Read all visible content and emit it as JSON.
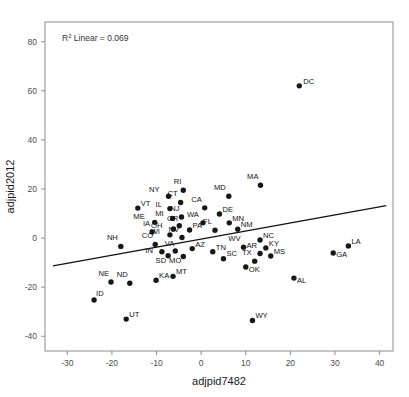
{
  "chart_data": {
    "type": "scatter",
    "title": "",
    "xlabel": "adjpid7482",
    "ylabel": "adjpid2012",
    "xlim": [
      -35,
      43
    ],
    "ylim": [
      -46,
      88
    ],
    "xticks": [
      -30,
      -20,
      -10,
      0,
      10,
      20,
      30,
      40
    ],
    "yticks": [
      -40,
      -20,
      0,
      20,
      40,
      60,
      80
    ],
    "grid": false,
    "legend": false,
    "annotation": {
      "text": "R2 Linear = 0.069",
      "r_squared": 0.069,
      "prefix": "R",
      "superscript": "2",
      "suffix": " Linear = 0.069"
    },
    "fit_line": {
      "type": "linear",
      "x_start": -33.2,
      "y_start": -11.3,
      "x_end": 41.5,
      "y_end": 13.2
    },
    "point_label_key": "state",
    "points": [
      {
        "state": "DC",
        "x": 22.0,
        "y": 62.0,
        "lx": 4,
        "ly": -2
      },
      {
        "state": "MA",
        "x": 13.3,
        "y": 21.5,
        "lx": -2,
        "ly": -6
      },
      {
        "state": "MD",
        "x": 6.2,
        "y": 17.0,
        "lx": -3,
        "ly": -6
      },
      {
        "state": "RI",
        "x": -4.0,
        "y": 19.5,
        "lx": -2,
        "ly": -6
      },
      {
        "state": "NY",
        "x": -7.3,
        "y": 17.0,
        "lx": -9,
        "ly": -4
      },
      {
        "state": "CT",
        "x": -4.6,
        "y": 14.5,
        "lx": -3,
        "ly": -6
      },
      {
        "state": "VT",
        "x": -14.2,
        "y": 12.2,
        "lx": 3,
        "ly": -2
      },
      {
        "state": "IL",
        "x": -7.0,
        "y": 12.0,
        "lx": -8,
        "ly": -2
      },
      {
        "state": "CA",
        "x": 0.8,
        "y": 12.3,
        "lx": -3,
        "ly": -6
      },
      {
        "state": "DE",
        "x": 4.1,
        "y": 9.8,
        "lx": 3,
        "ly": -2
      },
      {
        "state": "NJ",
        "x": -4.4,
        "y": 8.6,
        "lx": -2,
        "ly": -6
      },
      {
        "state": "MI",
        "x": -6.4,
        "y": 8.0,
        "lx": -9,
        "ly": -2
      },
      {
        "state": "ME",
        "x": -10.4,
        "y": 6.4,
        "lx": -10,
        "ly": -3
      },
      {
        "state": "WA",
        "x": 0.4,
        "y": 6.2,
        "lx": -4,
        "ly": -6
      },
      {
        "state": "MN",
        "x": 6.3,
        "y": 6.2,
        "lx": 3,
        "ly": -2
      },
      {
        "state": "OR",
        "x": -4.9,
        "y": 5.0,
        "lx": -1,
        "ly": -5
      },
      {
        "state": "OH",
        "x": -6.2,
        "y": 3.7,
        "lx": -11,
        "ly": -1
      },
      {
        "state": "PA",
        "x": -2.6,
        "y": 3.3,
        "lx": 3,
        "ly": -2
      },
      {
        "state": "FL",
        "x": 3.1,
        "y": 3.2,
        "lx": -3,
        "ly": -6
      },
      {
        "state": "NM",
        "x": 8.2,
        "y": 3.6,
        "lx": 3,
        "ly": -2
      },
      {
        "state": "IA",
        "x": -11.0,
        "y": 2.5,
        "lx": -2,
        "ly": -6
      },
      {
        "state": "WI",
        "x": -7.0,
        "y": 1.3,
        "lx": -10,
        "ly": -1
      },
      {
        "state": "NV",
        "x": -4.3,
        "y": 0.2,
        "lx": -3,
        "ly": -6
      },
      {
        "state": "NH",
        "x": -18.0,
        "y": -3.4,
        "lx": -3,
        "ly": -6
      },
      {
        "state": "CO",
        "x": -10.3,
        "y": -2.6,
        "lx": -2,
        "ly": -6
      },
      {
        "state": "NC",
        "x": 13.2,
        "y": -0.8,
        "lx": 3,
        "ly": -2
      },
      {
        "state": "KY",
        "x": 14.5,
        "y": -4.0,
        "lx": 3,
        "ly": -2
      },
      {
        "state": "LA",
        "x": 33.0,
        "y": -3.2,
        "lx": 3,
        "ly": -2
      },
      {
        "state": "GA",
        "x": 29.6,
        "y": -6.1,
        "lx": 3,
        "ly": 4
      },
      {
        "state": "AZ",
        "x": -2.0,
        "y": -4.3,
        "lx": 3,
        "ly": -2
      },
      {
        "state": "VA",
        "x": -5.8,
        "y": -5.3,
        "lx": -1,
        "ly": -5
      },
      {
        "state": "IN",
        "x": -8.8,
        "y": -5.6,
        "lx": -9,
        "ly": 1
      },
      {
        "state": "SD",
        "x": -7.4,
        "y": -7.2,
        "lx": -2,
        "ly": 7
      },
      {
        "state": "MO",
        "x": -4.0,
        "y": -7.5,
        "lx": -2,
        "ly": 7
      },
      {
        "state": "TN",
        "x": 2.6,
        "y": -5.6,
        "lx": 3,
        "ly": -2
      },
      {
        "state": "WV",
        "x": 9.5,
        "y": -3.7,
        "lx": -3,
        "ly": -6
      },
      {
        "state": "AR",
        "x": 13.2,
        "y": -6.3,
        "lx": -3,
        "ly": -6
      },
      {
        "state": "MS",
        "x": 15.6,
        "y": -7.3,
        "lx": 3,
        "ly": -2
      },
      {
        "state": "SC",
        "x": 5.0,
        "y": -8.4,
        "lx": 3,
        "ly": -3
      },
      {
        "state": "TX",
        "x": 12.0,
        "y": -9.4,
        "lx": -3,
        "ly": -6
      },
      {
        "state": "OK",
        "x": 10.0,
        "y": -11.8,
        "lx": 3,
        "ly": 5
      },
      {
        "state": "MT",
        "x": -6.3,
        "y": -15.6,
        "lx": 3,
        "ly": -2
      },
      {
        "state": "KA",
        "x": -10.1,
        "y": -17.2,
        "lx": 3,
        "ly": -2
      },
      {
        "state": "ND",
        "x": -16.0,
        "y": -18.4,
        "lx": -2,
        "ly": -6
      },
      {
        "state": "NE",
        "x": -20.2,
        "y": -17.9,
        "lx": -2,
        "ly": -6
      },
      {
        "state": "AL",
        "x": 20.8,
        "y": -16.3,
        "lx": 3,
        "ly": 5
      },
      {
        "state": "ID",
        "x": -24.0,
        "y": -25.2,
        "lx": 2,
        "ly": -4
      },
      {
        "state": "UT",
        "x": -16.8,
        "y": -33.0,
        "lx": 3,
        "ly": -2
      },
      {
        "state": "WY",
        "x": 11.5,
        "y": -33.6,
        "lx": 3,
        "ly": -3
      }
    ]
  }
}
